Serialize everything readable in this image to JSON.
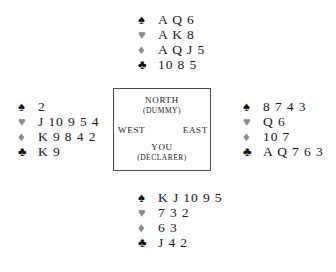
{
  "diagram": {
    "type": "bridge-hand-diagram",
    "suits": {
      "spade": {
        "glyph": "♠",
        "name": "spade-symbol",
        "color": "#101010"
      },
      "heart": {
        "glyph": "♥",
        "name": "heart-symbol",
        "color": "#8c8c8c"
      },
      "diamond": {
        "glyph": "♦",
        "name": "diamond-symbol",
        "color": "#8c8c8c"
      },
      "club": {
        "glyph": "♣",
        "name": "club-symbol",
        "color": "#101010"
      }
    },
    "hands": {
      "north": {
        "position": "North",
        "spades": "A Q 6",
        "hearts": "A K 8",
        "diamonds": "A Q J 5",
        "clubs": "10 8 5"
      },
      "west": {
        "position": "West",
        "spades": "2",
        "hearts": "J 10 9 5 4",
        "diamonds": "K 9 8 4 2",
        "clubs": "K 9"
      },
      "east": {
        "position": "East",
        "spades": "8 7 4 3",
        "hearts": "Q 6",
        "diamonds": "10 7",
        "clubs": "A Q 7 6 3"
      },
      "south": {
        "position": "South",
        "spades": "K J 10 9 5",
        "hearts": "7 3 2",
        "diamonds": "6 3",
        "clubs": "J 4 2"
      }
    },
    "compass": {
      "north_label": "NORTH",
      "north_sublabel": "(DUMMY)",
      "west_label": "WEST",
      "east_label": "EAST",
      "south_label": "YOU",
      "south_sublabel": "(DECLARER)"
    }
  }
}
